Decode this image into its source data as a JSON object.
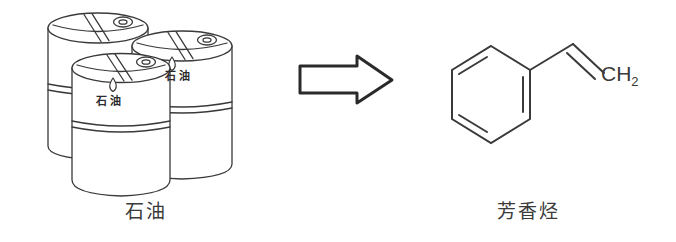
{
  "figure": {
    "type": "chemistry-process-illustration",
    "background_color": "#ffffff",
    "ink_color": "#3a3a3a"
  },
  "left": {
    "subject": "oil-drums",
    "caption": "石油",
    "drum_count": 3,
    "drums": [
      {
        "position": "back-left",
        "label": "",
        "has_droplet_icon": false,
        "has_bung_cap": true
      },
      {
        "position": "right",
        "label": "石油",
        "has_droplet_icon": true,
        "has_bung_cap": true
      },
      {
        "position": "front",
        "label": "石油",
        "has_droplet_icon": true,
        "has_bung_cap": true
      }
    ]
  },
  "arrow": {
    "direction": "right",
    "style": "outlined-block-arrow",
    "icon": "arrow-right-icon"
  },
  "right": {
    "subject": "aromatic-hydrocarbon-structure",
    "caption": "芳香烃",
    "molecule": {
      "name": "styrene",
      "ring": "benzene",
      "ring_notation": "kekule-alternating-double-bonds",
      "substituent": "vinyl",
      "terminal_label": "CH",
      "terminal_subscript": "2"
    }
  }
}
